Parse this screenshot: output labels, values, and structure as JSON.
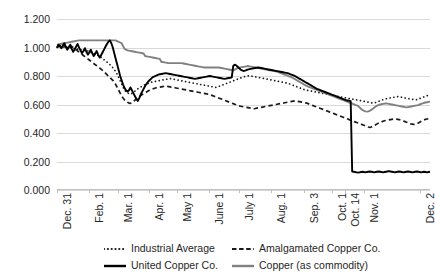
{
  "chart_data": {
    "type": "line",
    "title": "",
    "subtitle": "",
    "xlabel": "",
    "ylabel": "",
    "ylim": [
      0.0,
      1.2
    ],
    "ytick_labels": [
      "0.000",
      "0.200",
      "0.400",
      "0.600",
      "0.800",
      "1.000",
      "1.200"
    ],
    "ytick_values": [
      0.0,
      0.2,
      0.4,
      0.6,
      0.8,
      1.0,
      1.2
    ],
    "grid": true,
    "legend_position": "bottom",
    "xtick_labels": [
      "Dec. 31",
      "Feb. 1",
      "Mar. 1",
      "Apr. 1",
      "May 1",
      "June 1",
      "July 1",
      "Aug. 1",
      "Sep. 3",
      "Oct. 1",
      "Oct. 14",
      "Nov. 1",
      "Dec. 2"
    ],
    "xtick_positions": [
      0.0,
      0.0855,
      0.1625,
      0.2475,
      0.3225,
      0.4075,
      0.4875,
      0.5725,
      0.6625,
      0.7375,
      0.7725,
      0.8225,
      0.9725
    ],
    "series": [
      {
        "name": "Industrial Average",
        "style": "dotted",
        "color": "#1a1a1a",
        "values": [
          1.0,
          1.003,
          0.998,
          1.005,
          1.008,
          1.0,
          0.995,
          1.0,
          1.004,
          0.998,
          1.002,
          0.996,
          0.99,
          0.994,
          0.988,
          0.992,
          0.986,
          0.98,
          0.984,
          0.978,
          0.972,
          0.976,
          0.97,
          0.964,
          0.968,
          0.96,
          0.955,
          0.95,
          0.944,
          0.938,
          0.93,
          0.922,
          0.914,
          0.906,
          0.898,
          0.89,
          0.88,
          0.87,
          0.858,
          0.845,
          0.83,
          0.812,
          0.79,
          0.768,
          0.745,
          0.722,
          0.7,
          0.69,
          0.682,
          0.676,
          0.672,
          0.678,
          0.686,
          0.694,
          0.702,
          0.71,
          0.716,
          0.722,
          0.728,
          0.734,
          0.74,
          0.744,
          0.748,
          0.752,
          0.756,
          0.758,
          0.76,
          0.762,
          0.764,
          0.766,
          0.768,
          0.77,
          0.772,
          0.774,
          0.776,
          0.778,
          0.78,
          0.782,
          0.78,
          0.778,
          0.776,
          0.774,
          0.772,
          0.77,
          0.768,
          0.766,
          0.764,
          0.762,
          0.76,
          0.758,
          0.756,
          0.754,
          0.752,
          0.75,
          0.748,
          0.746,
          0.744,
          0.742,
          0.74,
          0.738,
          0.736,
          0.734,
          0.732,
          0.73,
          0.728,
          0.726,
          0.724,
          0.722,
          0.72,
          0.722,
          0.726,
          0.73,
          0.734,
          0.738,
          0.742,
          0.746,
          0.75,
          0.754,
          0.758,
          0.762,
          0.766,
          0.77,
          0.774,
          0.778,
          0.782,
          0.786,
          0.79,
          0.794,
          0.796,
          0.798,
          0.8,
          0.802,
          0.8,
          0.798,
          0.796,
          0.794,
          0.792,
          0.79,
          0.788,
          0.786,
          0.784,
          0.782,
          0.78,
          0.778,
          0.776,
          0.774,
          0.772,
          0.77,
          0.768,
          0.766,
          0.764,
          0.762,
          0.76,
          0.758,
          0.756,
          0.754,
          0.752,
          0.75,
          0.746,
          0.742,
          0.738,
          0.734,
          0.73,
          0.726,
          0.722,
          0.718,
          0.714,
          0.71,
          0.706,
          0.702,
          0.7,
          0.698,
          0.696,
          0.694,
          0.692,
          0.69,
          0.688,
          0.686,
          0.684,
          0.682,
          0.68,
          0.678,
          0.676,
          0.674,
          0.672,
          0.67,
          0.668,
          0.666,
          0.664,
          0.662,
          0.66,
          0.658,
          0.656,
          0.654,
          0.652,
          0.65,
          0.648,
          0.646,
          0.644,
          0.642,
          0.64,
          0.638,
          0.636,
          0.634,
          0.632,
          0.63,
          0.628,
          0.626,
          0.624,
          0.622,
          0.62,
          0.618,
          0.616,
          0.614,
          0.612,
          0.61,
          0.612,
          0.614,
          0.618,
          0.622,
          0.626,
          0.63,
          0.634,
          0.638,
          0.64,
          0.642,
          0.644,
          0.646,
          0.648,
          0.65,
          0.652,
          0.654,
          0.656,
          0.654,
          0.652,
          0.65,
          0.648,
          0.646,
          0.644,
          0.642,
          0.64,
          0.638,
          0.636,
          0.634,
          0.632,
          0.634,
          0.638,
          0.642,
          0.646,
          0.65,
          0.654,
          0.658,
          0.662,
          0.664,
          0.666
        ]
      },
      {
        "name": "Amalgamated Copper Co.",
        "style": "dashed",
        "color": "#1a1a1a",
        "values": [
          1.0,
          1.005,
          1.01,
          1.015,
          1.02,
          1.012,
          1.004,
          0.998,
          1.006,
          1.014,
          1.008,
          1.0,
          0.992,
          0.984,
          0.976,
          0.968,
          0.96,
          0.952,
          0.944,
          0.936,
          0.928,
          0.92,
          0.912,
          0.904,
          0.896,
          0.888,
          0.88,
          0.872,
          0.864,
          0.856,
          0.848,
          0.84,
          0.83,
          0.82,
          0.81,
          0.8,
          0.79,
          0.78,
          0.77,
          0.755,
          0.74,
          0.72,
          0.7,
          0.68,
          0.66,
          0.645,
          0.632,
          0.622,
          0.615,
          0.61,
          0.608,
          0.614,
          0.622,
          0.63,
          0.638,
          0.646,
          0.654,
          0.662,
          0.67,
          0.676,
          0.682,
          0.688,
          0.694,
          0.7,
          0.704,
          0.708,
          0.712,
          0.716,
          0.718,
          0.72,
          0.722,
          0.724,
          0.726,
          0.728,
          0.73,
          0.728,
          0.726,
          0.724,
          0.722,
          0.72,
          0.718,
          0.716,
          0.714,
          0.712,
          0.71,
          0.708,
          0.706,
          0.704,
          0.702,
          0.7,
          0.698,
          0.696,
          0.694,
          0.692,
          0.69,
          0.688,
          0.686,
          0.684,
          0.682,
          0.68,
          0.678,
          0.676,
          0.674,
          0.672,
          0.67,
          0.666,
          0.662,
          0.658,
          0.654,
          0.65,
          0.646,
          0.642,
          0.638,
          0.634,
          0.63,
          0.626,
          0.622,
          0.618,
          0.614,
          0.61,
          0.606,
          0.602,
          0.598,
          0.594,
          0.59,
          0.588,
          0.586,
          0.584,
          0.582,
          0.58,
          0.578,
          0.576,
          0.574,
          0.572,
          0.57,
          0.572,
          0.574,
          0.576,
          0.578,
          0.58,
          0.582,
          0.584,
          0.586,
          0.588,
          0.59,
          0.592,
          0.594,
          0.596,
          0.598,
          0.6,
          0.602,
          0.604,
          0.606,
          0.608,
          0.61,
          0.612,
          0.614,
          0.616,
          0.618,
          0.62,
          0.622,
          0.624,
          0.626,
          0.624,
          0.622,
          0.62,
          0.618,
          0.616,
          0.614,
          0.612,
          0.61,
          0.606,
          0.602,
          0.598,
          0.594,
          0.59,
          0.586,
          0.582,
          0.578,
          0.574,
          0.57,
          0.566,
          0.562,
          0.558,
          0.554,
          0.55,
          0.546,
          0.542,
          0.538,
          0.534,
          0.53,
          0.526,
          0.522,
          0.518,
          0.514,
          0.51,
          0.506,
          0.502,
          0.498,
          0.494,
          0.49,
          0.486,
          0.482,
          0.478,
          0.474,
          0.47,
          0.466,
          0.462,
          0.458,
          0.454,
          0.45,
          0.446,
          0.442,
          0.44,
          0.442,
          0.446,
          0.452,
          0.458,
          0.464,
          0.47,
          0.474,
          0.478,
          0.482,
          0.486,
          0.488,
          0.49,
          0.492,
          0.494,
          0.496,
          0.498,
          0.5,
          0.498,
          0.496,
          0.494,
          0.492,
          0.488,
          0.484,
          0.48,
          0.476,
          0.472,
          0.468,
          0.464,
          0.462,
          0.46,
          0.462,
          0.466,
          0.47,
          0.476,
          0.482,
          0.488,
          0.492,
          0.496,
          0.498,
          0.5,
          0.502
        ]
      },
      {
        "name": "United Copper Co.",
        "style": "solid",
        "color": "#000000",
        "values": [
          1.0,
          1.02,
          1.01,
          0.995,
          1.015,
          1.03,
          1.005,
          0.985,
          1.0,
          1.02,
          0.99,
          0.97,
          0.985,
          1.005,
          1.025,
          1.0,
          0.98,
          0.96,
          0.975,
          0.995,
          0.97,
          0.95,
          0.965,
          0.985,
          0.96,
          0.94,
          0.955,
          0.975,
          0.95,
          0.93,
          0.945,
          0.965,
          0.985,
          1.005,
          1.025,
          1.04,
          1.05,
          1.03,
          1.0,
          0.96,
          0.92,
          0.88,
          0.84,
          0.8,
          0.77,
          0.74,
          0.715,
          0.7,
          0.69,
          0.7,
          0.72,
          0.7,
          0.68,
          0.66,
          0.64,
          0.625,
          0.645,
          0.67,
          0.69,
          0.71,
          0.73,
          0.745,
          0.76,
          0.77,
          0.78,
          0.79,
          0.795,
          0.8,
          0.805,
          0.81,
          0.812,
          0.814,
          0.816,
          0.818,
          0.82,
          0.818,
          0.816,
          0.814,
          0.812,
          0.81,
          0.808,
          0.806,
          0.804,
          0.802,
          0.8,
          0.798,
          0.796,
          0.794,
          0.792,
          0.79,
          0.788,
          0.786,
          0.784,
          0.782,
          0.78,
          0.782,
          0.784,
          0.786,
          0.788,
          0.79,
          0.792,
          0.794,
          0.796,
          0.798,
          0.8,
          0.798,
          0.796,
          0.794,
          0.792,
          0.79,
          0.788,
          0.786,
          0.784,
          0.782,
          0.78,
          0.782,
          0.784,
          0.786,
          0.788,
          0.79,
          0.87,
          0.88,
          0.875,
          0.865,
          0.855,
          0.845,
          0.84,
          0.835,
          0.838,
          0.842,
          0.845,
          0.848,
          0.85,
          0.852,
          0.854,
          0.856,
          0.858,
          0.86,
          0.858,
          0.856,
          0.854,
          0.852,
          0.85,
          0.848,
          0.846,
          0.844,
          0.842,
          0.84,
          0.838,
          0.836,
          0.834,
          0.832,
          0.83,
          0.828,
          0.826,
          0.824,
          0.822,
          0.82,
          0.816,
          0.812,
          0.808,
          0.804,
          0.8,
          0.794,
          0.788,
          0.782,
          0.776,
          0.77,
          0.764,
          0.758,
          0.752,
          0.746,
          0.74,
          0.734,
          0.728,
          0.722,
          0.716,
          0.71,
          0.706,
          0.702,
          0.698,
          0.694,
          0.69,
          0.686,
          0.682,
          0.678,
          0.674,
          0.67,
          0.666,
          0.662,
          0.658,
          0.654,
          0.65,
          0.646,
          0.642,
          0.638,
          0.634,
          0.63,
          0.628,
          0.626,
          0.624,
          0.13,
          0.128,
          0.126,
          0.124,
          0.122,
          0.124,
          0.126,
          0.128,
          0.126,
          0.124,
          0.126,
          0.128,
          0.13,
          0.128,
          0.126,
          0.124,
          0.126,
          0.128,
          0.13,
          0.128,
          0.126,
          0.124,
          0.126,
          0.128,
          0.13,
          0.132,
          0.13,
          0.128,
          0.126,
          0.124,
          0.126,
          0.128,
          0.13,
          0.128,
          0.126,
          0.124,
          0.126,
          0.128,
          0.13,
          0.128,
          0.126,
          0.124,
          0.126,
          0.128,
          0.13,
          0.128,
          0.126,
          0.124,
          0.126,
          0.128,
          0.126,
          0.124,
          0.126,
          0.128
        ]
      },
      {
        "name": "Copper (as commodity)",
        "style": "solid",
        "color": "#808080",
        "values": [
          1.02,
          1.022,
          1.024,
          1.026,
          1.028,
          1.03,
          1.032,
          1.034,
          1.036,
          1.038,
          1.04,
          1.042,
          1.044,
          1.046,
          1.048,
          1.05,
          1.05,
          1.05,
          1.05,
          1.05,
          1.05,
          1.05,
          1.05,
          1.05,
          1.05,
          1.05,
          1.05,
          1.05,
          1.05,
          1.05,
          1.05,
          1.05,
          1.05,
          1.05,
          1.05,
          1.05,
          1.05,
          1.05,
          1.05,
          1.05,
          1.05,
          1.045,
          1.04,
          1.035,
          1.03,
          1.01,
          0.99,
          0.985,
          0.98,
          0.978,
          0.976,
          0.974,
          0.972,
          0.97,
          0.968,
          0.966,
          0.964,
          0.962,
          0.96,
          0.958,
          0.94,
          0.938,
          0.936,
          0.934,
          0.932,
          0.93,
          0.928,
          0.926,
          0.924,
          0.922,
          0.92,
          0.9,
          0.898,
          0.896,
          0.894,
          0.892,
          0.89,
          0.89,
          0.89,
          0.89,
          0.89,
          0.89,
          0.89,
          0.89,
          0.89,
          0.89,
          0.888,
          0.886,
          0.884,
          0.882,
          0.88,
          0.878,
          0.876,
          0.874,
          0.872,
          0.87,
          0.868,
          0.866,
          0.864,
          0.862,
          0.86,
          0.86,
          0.86,
          0.86,
          0.86,
          0.86,
          0.86,
          0.86,
          0.86,
          0.86,
          0.86,
          0.858,
          0.856,
          0.854,
          0.852,
          0.85,
          0.848,
          0.846,
          0.844,
          0.842,
          0.84,
          0.845,
          0.85,
          0.855,
          0.858,
          0.86,
          0.862,
          0.864,
          0.866,
          0.868,
          0.87,
          0.868,
          0.866,
          0.864,
          0.862,
          0.86,
          0.858,
          0.856,
          0.854,
          0.852,
          0.85,
          0.848,
          0.846,
          0.844,
          0.842,
          0.84,
          0.838,
          0.836,
          0.834,
          0.832,
          0.83,
          0.826,
          0.822,
          0.818,
          0.814,
          0.81,
          0.806,
          0.802,
          0.798,
          0.794,
          0.79,
          0.784,
          0.778,
          0.772,
          0.766,
          0.76,
          0.754,
          0.748,
          0.742,
          0.736,
          0.73,
          0.726,
          0.722,
          0.718,
          0.714,
          0.71,
          0.706,
          0.702,
          0.698,
          0.694,
          0.69,
          0.686,
          0.682,
          0.678,
          0.674,
          0.67,
          0.666,
          0.662,
          0.658,
          0.654,
          0.65,
          0.646,
          0.642,
          0.638,
          0.634,
          0.63,
          0.626,
          0.622,
          0.618,
          0.614,
          0.61,
          0.606,
          0.602,
          0.598,
          0.594,
          0.59,
          0.58,
          0.57,
          0.562,
          0.556,
          0.552,
          0.55,
          0.552,
          0.556,
          0.562,
          0.57,
          0.578,
          0.586,
          0.592,
          0.596,
          0.6,
          0.602,
          0.604,
          0.606,
          0.608,
          0.606,
          0.604,
          0.602,
          0.6,
          0.598,
          0.596,
          0.594,
          0.592,
          0.59,
          0.588,
          0.586,
          0.584,
          0.582,
          0.58,
          0.582,
          0.584,
          0.586,
          0.588,
          0.59,
          0.592,
          0.594,
          0.596,
          0.6,
          0.604,
          0.608,
          0.612,
          0.614,
          0.616,
          0.618,
          0.62
        ]
      }
    ]
  },
  "legend": {
    "items": [
      {
        "label": "Industrial Average",
        "style": "dotted",
        "color": "#1a1a1a"
      },
      {
        "label": "Amalgamated Copper Co.",
        "style": "dashed",
        "color": "#1a1a1a"
      },
      {
        "label": "United Copper Co.",
        "style": "solid",
        "color": "#000000"
      },
      {
        "label": "Copper (as commodity)",
        "style": "solid",
        "color": "#808080"
      }
    ]
  }
}
